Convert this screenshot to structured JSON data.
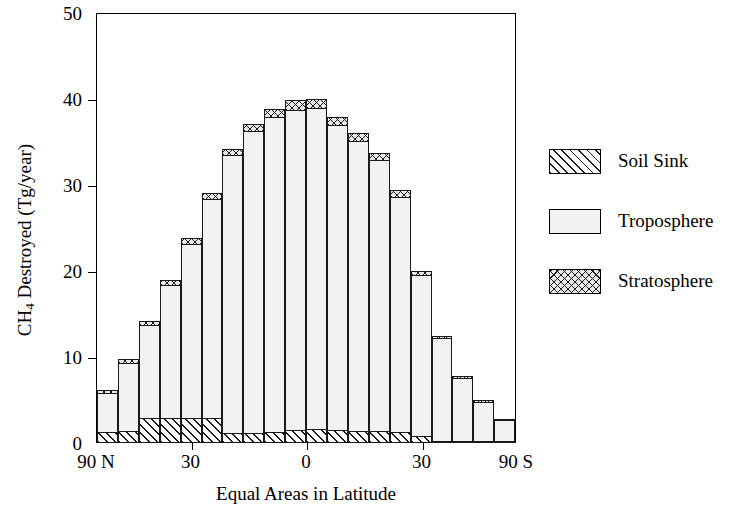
{
  "chart_data": {
    "type": "bar",
    "stacked": true,
    "title": "",
    "xlabel": "Equal Areas in Latitude",
    "ylabel": "CH4 Destroyed (Tg/year)",
    "ylabel_parts": {
      "pre": "CH",
      "sub": "4",
      "post": " Destroyed (Tg/year)"
    },
    "ylim": [
      0,
      50
    ],
    "yticks": [
      0,
      10,
      20,
      30,
      40,
      50
    ],
    "ytick_labels": [
      "0",
      "10",
      "20",
      "30",
      "40",
      "50"
    ],
    "xtick_labels": [
      "90 N",
      "30",
      "0",
      "30",
      "90 S"
    ],
    "xtick_positions": [
      0,
      4.5,
      10,
      15.5,
      20
    ],
    "grid": false,
    "legend_position": "right",
    "categories": [
      "1",
      "2",
      "3",
      "4",
      "5",
      "6",
      "7",
      "8",
      "9",
      "10",
      "11",
      "12",
      "13",
      "14",
      "15",
      "16",
      "17",
      "18",
      "19",
      "20"
    ],
    "series": [
      {
        "name": "Soil Sink",
        "pattern": "diagonal-hatch",
        "values": [
          1.3,
          1.4,
          2.9,
          2.9,
          2.9,
          2.9,
          1.2,
          1.2,
          1.3,
          1.5,
          1.6,
          1.5,
          1.4,
          1.4,
          1.3,
          0.8,
          0.3,
          0.15,
          0.1,
          0.1
        ]
      },
      {
        "name": "Troposphere",
        "pattern": "dots",
        "values": [
          4.6,
          8.1,
          11.0,
          15.6,
          20.4,
          25.6,
          32.4,
          35.2,
          36.7,
          37.4,
          37.5,
          35.6,
          33.9,
          31.6,
          27.5,
          18.9,
          12.0,
          7.5,
          4.7,
          2.6
        ]
      },
      {
        "name": "Stratosphere",
        "pattern": "cross-hatch",
        "values": [
          0.5,
          0.5,
          0.6,
          0.7,
          0.8,
          0.8,
          0.9,
          1.0,
          1.1,
          1.2,
          1.2,
          1.1,
          1.0,
          1.0,
          0.9,
          0.6,
          0.4,
          0.35,
          0.3,
          0.25
        ]
      }
    ],
    "totals": [
      6.4,
      10.0,
      14.5,
      19.2,
      24.1,
      29.3,
      34.5,
      37.4,
      39.1,
      40.1,
      40.3,
      38.2,
      36.3,
      34.0,
      29.7,
      20.3,
      12.7,
      8.0,
      5.1,
      2.95
    ]
  },
  "legend": {
    "items": [
      {
        "label": "Soil Sink",
        "pattern": "diagonal-hatch"
      },
      {
        "label": "Troposphere",
        "pattern": "dots"
      },
      {
        "label": "Stratosphere",
        "pattern": "cross-hatch"
      }
    ]
  }
}
